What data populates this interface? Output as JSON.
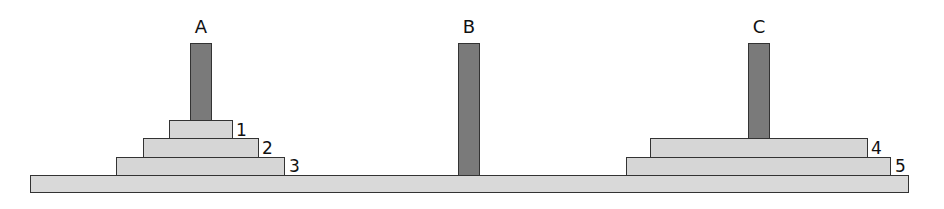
{
  "diagram": {
    "title": "",
    "pegs": [
      {
        "id": "A",
        "label": "A",
        "disks": [
          1,
          2,
          3
        ]
      },
      {
        "id": "B",
        "label": "B",
        "disks": []
      },
      {
        "id": "C",
        "label": "C",
        "disks": [
          4,
          5
        ]
      }
    ],
    "disks": [
      {
        "number": 1,
        "label": "1",
        "peg": "A"
      },
      {
        "number": 2,
        "label": "2",
        "peg": "A"
      },
      {
        "number": 3,
        "label": "3",
        "peg": "A"
      },
      {
        "number": 4,
        "label": "4",
        "peg": "C"
      },
      {
        "number": 5,
        "label": "5",
        "peg": "C"
      }
    ],
    "colors": {
      "peg": "#7a7a7a",
      "disk": "#d6d6d6",
      "base": "#d9d9d9",
      "outline": "#333333"
    }
  }
}
